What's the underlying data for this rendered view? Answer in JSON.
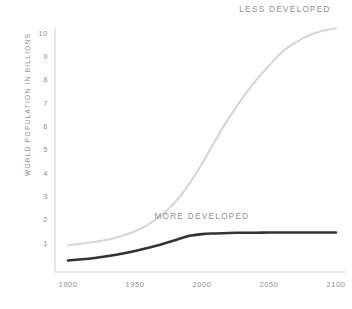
{
  "chart_data": {
    "type": "line",
    "title": "",
    "subtitle": "",
    "xlabel": "",
    "ylabel": "WORLD POPULATION IN BILLIONS",
    "xlim": [
      1900,
      2100
    ],
    "ylim": [
      0,
      10.5
    ],
    "grid": false,
    "legend_position": "inline-annotations",
    "x_tick_labels": [
      "1900",
      "1950",
      "2000",
      "2050",
      "2100"
    ],
    "x_ticks": [
      1900,
      1950,
      2000,
      2050,
      2100
    ],
    "y_tick_labels": [
      "1",
      "2",
      "3",
      "4",
      "5",
      "6",
      "7",
      "8",
      "9",
      "10"
    ],
    "y_ticks": [
      1,
      2,
      3,
      4,
      5,
      6,
      7,
      8,
      9,
      10
    ],
    "x": [
      1900,
      1910,
      1920,
      1930,
      1940,
      1950,
      1960,
      1970,
      1980,
      1990,
      2000,
      2010,
      2020,
      2030,
      2040,
      2050,
      2060,
      2070,
      2080,
      2090,
      2100
    ],
    "series": [
      {
        "name": "LESS DEVELOPED",
        "color": "#d6d6d6",
        "label_x": 2062,
        "label_y": 10.9,
        "values": [
          0.9,
          0.97,
          1.05,
          1.15,
          1.3,
          1.5,
          1.8,
          2.2,
          2.75,
          3.5,
          4.4,
          5.4,
          6.35,
          7.2,
          7.95,
          8.6,
          9.2,
          9.6,
          9.9,
          10.1,
          10.2
        ]
      },
      {
        "name": "MORE DEVELOPED",
        "color": "#333333",
        "label_x": 2000,
        "label_y": 2.05,
        "values": [
          0.25,
          0.3,
          0.36,
          0.44,
          0.54,
          0.66,
          0.8,
          0.95,
          1.12,
          1.3,
          1.38,
          1.41,
          1.43,
          1.44,
          1.44,
          1.45,
          1.45,
          1.45,
          1.45,
          1.45,
          1.45
        ]
      }
    ]
  }
}
